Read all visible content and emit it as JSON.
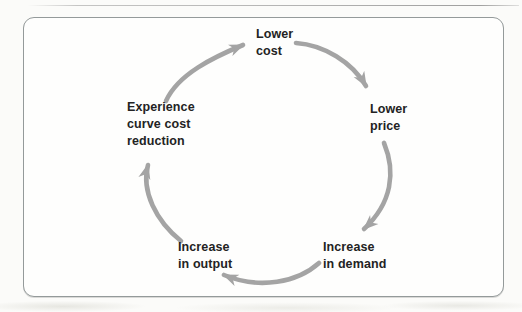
{
  "diagram": {
    "type": "cycle",
    "nodes": [
      {
        "id": "lower-cost",
        "label": "Lower cost",
        "lines": [
          "Lower",
          "cost"
        ],
        "position": "top"
      },
      {
        "id": "lower-price",
        "label": "Lower price",
        "lines": [
          "Lower",
          "price"
        ],
        "position": "right"
      },
      {
        "id": "increase-demand",
        "label": "Increase in demand",
        "lines": [
          "Increase",
          "in demand"
        ],
        "position": "bottom-right"
      },
      {
        "id": "increase-output",
        "label": "Increase in output",
        "lines": [
          "Increase",
          "in output"
        ],
        "position": "bottom-left"
      },
      {
        "id": "experience-curve-cost-reduction",
        "label": "Experience curve cost reduction",
        "lines": [
          "Experience",
          "curve cost",
          "reduction"
        ],
        "position": "left"
      }
    ],
    "edges": [
      {
        "from": "lower-cost",
        "to": "lower-price"
      },
      {
        "from": "lower-price",
        "to": "increase-demand"
      },
      {
        "from": "increase-demand",
        "to": "increase-output"
      },
      {
        "from": "increase-output",
        "to": "experience-curve-cost-reduction"
      },
      {
        "from": "experience-curve-cost-reduction",
        "to": "lower-cost"
      }
    ],
    "direction": "clockwise",
    "colors": {
      "arrow": "#a4a4a4",
      "text": "#232323",
      "frame_border": "#949a9a",
      "frame_background": "#fefefd",
      "page_background": "#fbfbf9"
    }
  }
}
